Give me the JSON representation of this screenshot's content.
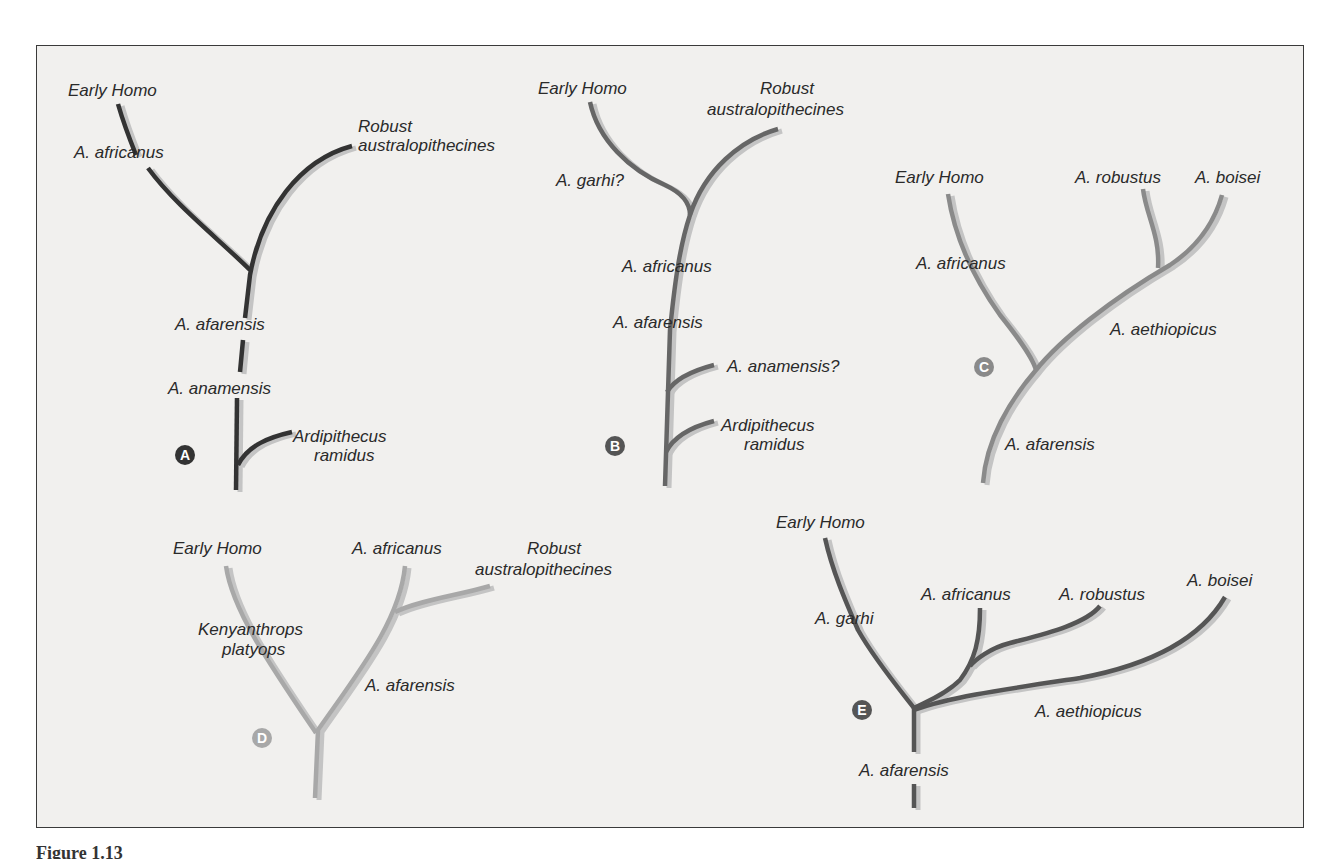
{
  "figure": {
    "caption_partial": "Figure 1.13",
    "background": "#f1f0ee",
    "frame_border": "#3a3a3a",
    "shadow_color": "#c4c4c4"
  },
  "trees": [
    {
      "id": "A",
      "badge": "A",
      "color": "#333333",
      "badge_color": "#333333",
      "badge_pos": [
        185,
        455
      ],
      "branches": [
        {
          "d": "M118 104 C124 125 130 140 136 155"
        },
        {
          "d": "M148 168 C175 205 220 240 250 270"
        },
        {
          "d": "M352 146 C300 160 262 210 250 275 L245 318"
        },
        {
          "d": "M243 340 L240 372"
        },
        {
          "d": "M237 398 L236 490"
        },
        {
          "d": "M292 432 C270 437 248 445 238 465"
        }
      ],
      "labels": [
        {
          "text": "Early Homo",
          "x": 68,
          "y": 96
        },
        {
          "text": "A. africanus",
          "x": 74,
          "y": 158
        },
        {
          "text": "Robust",
          "x": 358,
          "y": 132
        },
        {
          "text": "australopithecines",
          "x": 358,
          "y": 151
        },
        {
          "text": "A. afarensis",
          "x": 175,
          "y": 330
        },
        {
          "text": "A. anamensis",
          "x": 168,
          "y": 394
        },
        {
          "text": "Ardipithecus",
          "x": 293,
          "y": 442
        },
        {
          "text": "ramidus",
          "x": 314,
          "y": 461
        }
      ]
    },
    {
      "id": "B",
      "badge": "B",
      "color": "#666666",
      "badge_color": "#555555",
      "badge_pos": [
        615,
        446
      ],
      "branches": [
        {
          "d": "M590 102 C598 140 630 170 665 185 C680 192 690 202 690 215"
        },
        {
          "d": "M778 129 C740 140 705 170 690 215 C680 245 675 280 670 330 L665 486"
        },
        {
          "d": "M714 365 C695 370 675 378 667 392"
        },
        {
          "d": "M714 421 C695 426 675 434 666 452"
        }
      ],
      "labels": [
        {
          "text": "Early Homo",
          "x": 538,
          "y": 94
        },
        {
          "text": "Robust",
          "x": 760,
          "y": 94
        },
        {
          "text": "australopithecines",
          "x": 707,
          "y": 115
        },
        {
          "text": "A. garhi?",
          "x": 556,
          "y": 186
        },
        {
          "text": "A. africanus",
          "x": 622,
          "y": 272
        },
        {
          "text": "A. afarensis",
          "x": 613,
          "y": 328
        },
        {
          "text": "A. anamensis?",
          "x": 727,
          "y": 372
        },
        {
          "text": "Ardipithecus",
          "x": 721,
          "y": 431
        },
        {
          "text": "ramidus",
          "x": 744,
          "y": 450
        }
      ]
    },
    {
      "id": "C",
      "badge": "C",
      "color": "#8a8a8a",
      "badge_color": "#8a8a8a",
      "badge_pos": [
        984,
        367
      ],
      "branches": [
        {
          "d": "M948 194 C955 240 975 280 1000 315 C1012 330 1032 355 1036 370"
        },
        {
          "d": "M1222 195 C1215 220 1200 245 1170 265 C1110 300 1060 340 1036 370 C1010 400 986 440 983 483"
        },
        {
          "d": "M1143 189 C1146 215 1160 235 1158 268"
        }
      ],
      "labels": [
        {
          "text": "Early Homo",
          "x": 895,
          "y": 183
        },
        {
          "text": "A. robustus",
          "x": 1075,
          "y": 183
        },
        {
          "text": "A. boisei",
          "x": 1195,
          "y": 183
        },
        {
          "text": "A. africanus",
          "x": 916,
          "y": 269
        },
        {
          "text": "A. aethiopicus",
          "x": 1110,
          "y": 335
        },
        {
          "text": "A. afarensis",
          "x": 1005,
          "y": 450
        }
      ]
    },
    {
      "id": "D",
      "badge": "D",
      "color": "#a8a8a8",
      "badge_color": "#a8a8a8",
      "badge_pos": [
        262,
        738
      ],
      "branches": [
        {
          "d": "M226 566 C232 610 270 665 316 733"
        },
        {
          "d": "M405 566 C400 620 360 670 318 730 L315 798"
        },
        {
          "d": "M490 586 C460 595 420 600 395 612"
        }
      ],
      "labels": [
        {
          "text": "Early Homo",
          "x": 173,
          "y": 554
        },
        {
          "text": "A. africanus",
          "x": 352,
          "y": 554
        },
        {
          "text": "Robust",
          "x": 527,
          "y": 554
        },
        {
          "text": "australopithecines",
          "x": 475,
          "y": 575
        },
        {
          "text": "Kenyanthrops",
          "x": 198,
          "y": 635
        },
        {
          "text": "platyops",
          "x": 222,
          "y": 655
        },
        {
          "text": "A. afarensis",
          "x": 365,
          "y": 691
        }
      ]
    },
    {
      "id": "E",
      "badge": "E",
      "color": "#555555",
      "badge_color": "#555555",
      "badge_pos": [
        862,
        710
      ],
      "branches": [
        {
          "d": "M825 538 C832 570 845 600 858 630 C875 660 900 690 914 708"
        },
        {
          "d": "M980 608 C980 640 975 660 960 680 C945 695 925 702 914 708"
        },
        {
          "d": "M1100 606 C1085 625 1040 635 1010 643 C990 648 975 660 970 666"
        },
        {
          "d": "M1225 597 C1200 640 1150 665 1080 678 C1000 690 950 697 914 710"
        },
        {
          "d": "M914 708 L914 752"
        },
        {
          "d": "M914 784 L914 808"
        }
      ],
      "labels": [
        {
          "text": "Early Homo",
          "x": 776,
          "y": 528
        },
        {
          "text": "A. garhi",
          "x": 815,
          "y": 624
        },
        {
          "text": "A. africanus",
          "x": 921,
          "y": 600
        },
        {
          "text": "A. robustus",
          "x": 1059,
          "y": 600
        },
        {
          "text": "A. boisei",
          "x": 1187,
          "y": 586
        },
        {
          "text": "A. aethiopicus",
          "x": 1035,
          "y": 717
        },
        {
          "text": "A. afarensis",
          "x": 859,
          "y": 776
        }
      ]
    }
  ]
}
